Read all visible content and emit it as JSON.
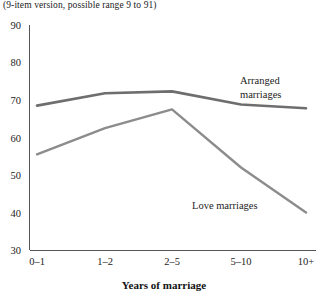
{
  "chart_data": {
    "type": "line",
    "title": "(9-item version, possible range 9 to 91)",
    "xlabel": "Years of marriage",
    "ylabel": "",
    "categories": [
      "0–1",
      "1–2",
      "2–5",
      "5–10",
      "10+"
    ],
    "ylim": [
      30,
      90
    ],
    "yticks": [
      30,
      40,
      50,
      60,
      70,
      80,
      90
    ],
    "ytick_labels": [
      "30",
      "40",
      "50",
      "60",
      "70",
      "80",
      "90"
    ],
    "grid": false,
    "legend_position": "inline-annotation",
    "series": [
      {
        "name": "Arranged marriages",
        "values": [
          68.5,
          71.8,
          72.3,
          68.8,
          67.8
        ],
        "color": "#6e6e6e",
        "stroke_width": 2.6,
        "annotation": "Arranged\nmarriages",
        "annotation_line1": "Arranged",
        "annotation_line2": "marriages"
      },
      {
        "name": "Love marriages",
        "values": [
          55.5,
          62.5,
          67.5,
          52.0,
          40.0
        ],
        "color": "#8c8c8c",
        "stroke_width": 2.4,
        "annotation": "Love marriages",
        "annotation_line1": "Love marriages",
        "annotation_line2": ""
      }
    ]
  },
  "axes": {
    "y_tick_0": "30",
    "y_tick_1": "40",
    "y_tick_2": "50",
    "y_tick_3": "60",
    "y_tick_4": "70",
    "y_tick_5": "80",
    "y_tick_6": "90",
    "x_tick_0": "0–1",
    "x_tick_1": "1–2",
    "x_tick_2": "2–5",
    "x_tick_3": "5–10",
    "x_tick_4": "10+",
    "x_axis_title": "Years of marriage"
  },
  "annotations": {
    "arranged_line1": "Arranged",
    "arranged_line2": "marriages",
    "love_line1": "Love marriages"
  },
  "colors": {
    "arranged": "#6e6e6e",
    "love": "#8c8c8c",
    "axis": "#555555",
    "text": "#232323",
    "background": "#ffffff"
  }
}
